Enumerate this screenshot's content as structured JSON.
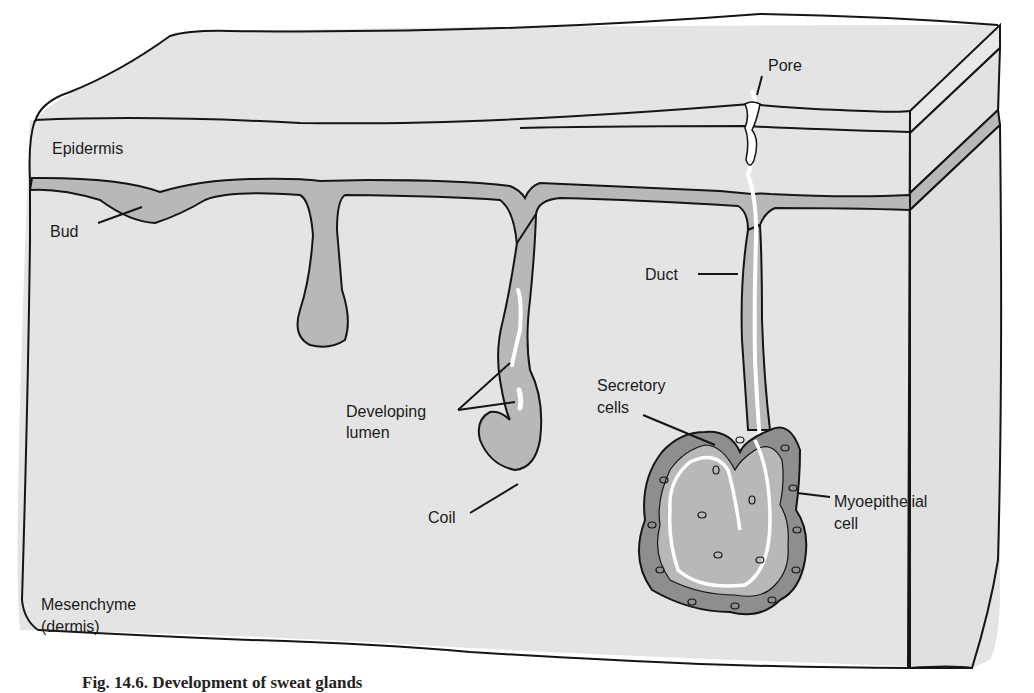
{
  "figure": {
    "type": "schematic cross-section of skin showing stages of sweat gland development",
    "colors": {
      "background": "#ffffff",
      "tissue_fill": "#e4e4e4",
      "epithelium_fill": "#b8b8b8",
      "gland_dark_fill": "#8e8e8e",
      "lumen": "#ffffff",
      "outline": "#151515"
    },
    "labels": {
      "epidermis": "Epidermis",
      "bud": "Bud",
      "pore": "Pore",
      "duct": "Duct",
      "developing_lumen_line1": "Developing",
      "developing_lumen_line2": "lumen",
      "coil": "Coil",
      "secretory_line1": "Secretory",
      "secretory_line2": "cells",
      "myoepithelial_line1": "Myoepithelial",
      "myoepithelial_line2": "cell",
      "mesenchyme_line1": "Mesenchyme",
      "mesenchyme_line2": "(dermis)"
    },
    "caption": "Fig. 14.6. Development of sweat glands"
  }
}
